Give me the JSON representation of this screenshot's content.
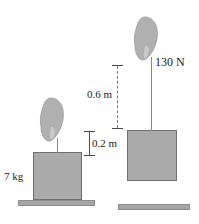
{
  "figure": {
    "colors": {
      "block_fill": "#aaaaaa",
      "block_stroke": "#6f6f6f",
      "ground_fill": "#a6a6a6",
      "hand_fill": "#b0b0b0",
      "rope": "#8a8a8a",
      "text": "#1a1a1a",
      "dimension_line": "#7a7a7a"
    }
  },
  "left_scene": {
    "mass_label": "7 kg",
    "hand_icon": "hand-gripping-rope-icon",
    "block_name": "block-left",
    "ground_name": "ground-left",
    "rope_name": "rope-left"
  },
  "right_scene": {
    "force_label": "130 N",
    "hand_icon": "hand-gripping-rope-icon",
    "block_name": "block-right",
    "ground_name": "ground-right",
    "rope_name": "rope-right"
  },
  "dimensions": [
    {
      "id": "height-06",
      "label": "0.6 m",
      "value": 0.6,
      "unit": "m"
    },
    {
      "id": "height-02",
      "label": "0.2 m",
      "value": 0.2,
      "unit": "m"
    }
  ]
}
